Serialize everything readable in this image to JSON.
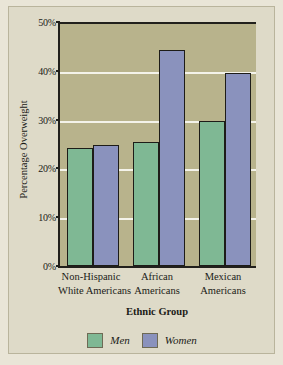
{
  "chart_data": {
    "type": "bar",
    "title": "",
    "xlabel": "Ethnic Group",
    "ylabel": "Percentage Overweight",
    "categories": [
      "Non-Hispanic White Americans",
      "African Americans",
      "Mexican Americans"
    ],
    "category_lines": [
      [
        "Non-Hispanic",
        "White Americans"
      ],
      [
        "African",
        "Americans"
      ],
      [
        "Mexican",
        "Americans"
      ]
    ],
    "series": [
      {
        "name": "Men",
        "color": "#7fb894",
        "values": [
          24.2,
          25.5,
          29.7
        ]
      },
      {
        "name": "Women",
        "color": "#8a92bd",
        "values": [
          24.9,
          44.3,
          39.5
        ]
      }
    ],
    "ylim": [
      0,
      50
    ],
    "ytick_values": [
      0,
      10,
      20,
      30,
      40,
      50
    ],
    "ytick_labels": [
      "0%",
      "10%",
      "20%",
      "30%",
      "40%",
      "50%"
    ],
    "grid": true,
    "gridline_color": "#f4f3ea",
    "legend_position": "bottom-center",
    "plot_background": "#b8b38c",
    "figure_background": "#dedac8"
  }
}
